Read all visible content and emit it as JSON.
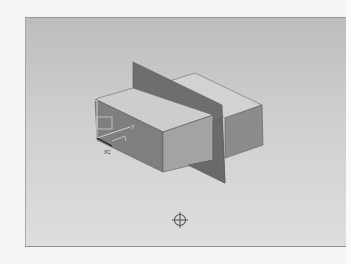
{
  "viewport": {
    "name": "3D graphics window",
    "background_top": "#bdbdbd",
    "background_bottom": "#dedede"
  },
  "model": {
    "body": "rectangular block",
    "plane": "datum plane intersecting block",
    "colors": {
      "top_face": "#cfcfcf",
      "side_face_light": "#9a9a9a",
      "side_face_dark": "#7e7e7e",
      "plane": "#6f6f6f",
      "edge": "#5a5a5a"
    }
  },
  "csys": {
    "axes": [
      {
        "label": "Z"
      },
      {
        "label": "Y"
      },
      {
        "label": "XC"
      }
    ]
  },
  "cursor": {
    "icon": "crosshair-icon"
  }
}
